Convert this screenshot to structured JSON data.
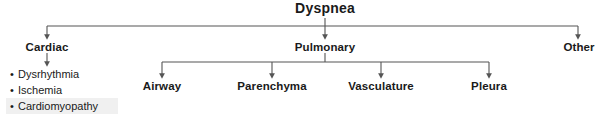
{
  "diagram": {
    "title": "Dyspnea",
    "type": "flowchart",
    "line_color": "#555555",
    "text_color": "#1a1a1a",
    "highlight_color": "#f0f0f0",
    "background_color": "#ffffff",
    "level1": [
      {
        "id": "cardiac",
        "label": "Cardiac",
        "x": 47
      },
      {
        "id": "pulmonary",
        "label": "Pulmonary",
        "x": 325
      },
      {
        "id": "other",
        "label": "Other",
        "x": 579
      }
    ],
    "cardiac_children": [
      {
        "id": "dysrhythmia",
        "label": "Dysrhythmia",
        "bullet": "•",
        "highlighted": false
      },
      {
        "id": "ischemia",
        "label": "Ischemia",
        "bullet": "•",
        "highlighted": false
      },
      {
        "id": "cardiomyopathy",
        "label": "Cardiomyopathy",
        "bullet": "•",
        "highlighted": true
      }
    ],
    "pulmonary_children": [
      {
        "id": "airway",
        "label": "Airway",
        "x": 162
      },
      {
        "id": "parenchyma",
        "label": "Parenchyma",
        "x": 272
      },
      {
        "id": "vasculature",
        "label": "Vasculature",
        "x": 381
      },
      {
        "id": "pleura",
        "label": "Pleura",
        "x": 489
      }
    ]
  }
}
